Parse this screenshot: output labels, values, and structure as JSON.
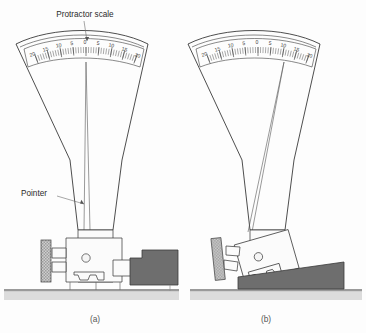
{
  "figure": {
    "background_color": "#fdfdfd",
    "annotations": [
      {
        "id": "protractor-scale",
        "label": "Protractor scale",
        "x": 85,
        "y": 17
      },
      {
        "id": "pointer",
        "label": "Pointer",
        "x": 21,
        "y": 196
      }
    ],
    "captions": [
      {
        "id": "caption-a",
        "label": "(a)",
        "x": 95,
        "y": 322
      },
      {
        "id": "caption-b",
        "label": "(b)",
        "x": 266,
        "y": 322
      }
    ],
    "colors": {
      "outline": "#2e2e2e",
      "workpiece_fill": "#6e6e6e",
      "workpiece_stroke": "#3a3a3a",
      "ground_fill": "#dcdcdc",
      "ground_top": "#9a9a9a",
      "gauge_fill": "#fbfbfb",
      "hatch_fill": "#b9b9b9",
      "text": "#2b2b2b",
      "caption_text": "#555555"
    },
    "panels": [
      {
        "id": "panel-a",
        "caption": "(a)",
        "description": "Protractor gauge resting on a flat stepped workpiece, pointer reads zero",
        "pointer_reading": 0,
        "pointer_side": "center",
        "body_tilted": false,
        "workpiece_shape": "stepped-flat"
      },
      {
        "id": "panel-b",
        "caption": "(b)",
        "description": "Protractor gauge tilted on a tapered workpiece, pointer deflected to the right",
        "pointer_reading": 10,
        "pointer_side": "right",
        "body_tilted": true,
        "workpiece_shape": "tapered-wedge"
      }
    ],
    "scale": {
      "id": "protractor-scale",
      "labels": [
        "20",
        "15",
        "10",
        "5",
        "0",
        "5",
        "10",
        "15",
        "20"
      ],
      "values": [
        -20,
        -15,
        -10,
        -5,
        0,
        5,
        10,
        15,
        20
      ],
      "major_interval": 5,
      "minor_ticks_per_major": 5,
      "units": "degrees",
      "span_degrees": 40,
      "symmetric": true
    }
  }
}
